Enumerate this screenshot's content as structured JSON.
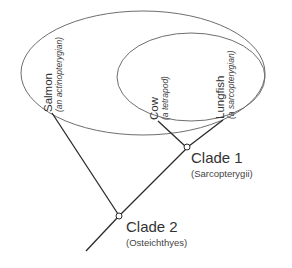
{
  "diagram": {
    "type": "cladogram",
    "taxa": [
      {
        "name": "Salmon",
        "description": "(an actinopterygian)"
      },
      {
        "name": "Cow",
        "description": "(a tetrapod)"
      },
      {
        "name": "Lungfish",
        "description": "(a sarcopterygian)"
      }
    ],
    "clades": [
      {
        "name": "Clade 1",
        "group": "(Sarcopterygii)"
      },
      {
        "name": "Clade 2",
        "group": "(Osteichthyes)"
      }
    ],
    "colors": {
      "ellipse_stroke": "#6e6e6e",
      "branch_stroke": "#2a2a2a",
      "text": "#333333",
      "background": "#ffffff"
    }
  }
}
